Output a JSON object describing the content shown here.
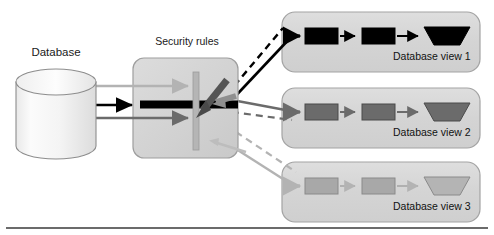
{
  "diagram": {
    "type": "flow-diagram",
    "title_shown": false,
    "background": "#ffffff",
    "bottom_rule": {
      "color": "#3a3a3a",
      "y": 228
    },
    "source": {
      "name": "database",
      "label": "Database",
      "shape": "cylinder",
      "fill": "#f2f2f2",
      "stroke": "#8a8a8a"
    },
    "filter": {
      "name": "security-rules",
      "label": "Security rules",
      "shape": "rounded-rect",
      "fill": "#d3d3d3",
      "stroke": "#9a9a9a",
      "barrier": {
        "orientation": "vertical",
        "color": "#b0b0b0"
      },
      "blocked_arrow": {
        "direction": "down-left",
        "color": "#4d4d4d"
      }
    },
    "flows": [
      {
        "name": "flow-top",
        "color": "#b3b3b3",
        "style": "solid",
        "target": "view-3"
      },
      {
        "name": "flow-middle",
        "color": "#000000",
        "style": "solid",
        "target": "view-1"
      },
      {
        "name": "flow-bottom",
        "color": "#6b6b6b",
        "style": "solid",
        "target": "view-2"
      }
    ],
    "connectors": [
      {
        "name": "connector-view-1",
        "color": "#000000",
        "style": "solid",
        "from": "security-rules",
        "to": "view-1"
      },
      {
        "name": "connector-view-1-dashed",
        "color": "#000000",
        "style": "dashed",
        "from": "security-rules",
        "to": "view-1"
      },
      {
        "name": "connector-view-2",
        "color": "#6b6b6b",
        "style": "solid",
        "from": "security-rules",
        "to": "view-2"
      },
      {
        "name": "connector-view-2-dashed",
        "color": "#6b6b6b",
        "style": "dashed",
        "from": "security-rules",
        "to": "view-2"
      },
      {
        "name": "connector-view-3",
        "color": "#b3b3b3",
        "style": "solid",
        "from": "security-rules",
        "to": "view-3"
      },
      {
        "name": "connector-view-3-dashed",
        "color": "#b3b3b3",
        "style": "dashed",
        "from": "security-rules",
        "to": "view-3"
      }
    ],
    "views": [
      {
        "id": "view-1",
        "label": "Database view 1",
        "panel_fill": "#d6d6d6",
        "panel_stroke": "#a0a0a0",
        "accent": "#000000",
        "nodes": [
          {
            "name": "process-box",
            "shape": "rect",
            "fill": "#000000",
            "stroke": "#000000"
          },
          {
            "name": "process-box",
            "shape": "rect",
            "fill": "#000000",
            "stroke": "#000000"
          },
          {
            "name": "output-parallelogram",
            "shape": "parallelogram",
            "fill": "#000000",
            "stroke": "#000000"
          }
        ]
      },
      {
        "id": "view-2",
        "label": "Database view 2",
        "panel_fill": "#d6d6d6",
        "panel_stroke": "#a0a0a0",
        "accent": "#6b6b6b",
        "nodes": [
          {
            "name": "process-box",
            "shape": "rect",
            "fill": "#6b6b6b",
            "stroke": "#4a4a4a"
          },
          {
            "name": "process-box",
            "shape": "rect",
            "fill": "#6b6b6b",
            "stroke": "#4a4a4a"
          },
          {
            "name": "output-parallelogram",
            "shape": "parallelogram",
            "fill": "#6b6b6b",
            "stroke": "#4a4a4a"
          }
        ]
      },
      {
        "id": "view-3",
        "label": "Database view 3",
        "panel_fill": "#d6d6d6",
        "panel_stroke": "#a0a0a0",
        "accent": "#b3b3b3",
        "nodes": [
          {
            "name": "process-box",
            "shape": "rect",
            "fill": "#a8a8a8",
            "stroke": "#8a8a8a"
          },
          {
            "name": "process-box",
            "shape": "rect",
            "fill": "#a8a8a8",
            "stroke": "#8a8a8a"
          },
          {
            "name": "output-parallelogram",
            "shape": "parallelogram",
            "fill": "#b0b0b0",
            "stroke": "#8a8a8a"
          }
        ]
      }
    ]
  }
}
